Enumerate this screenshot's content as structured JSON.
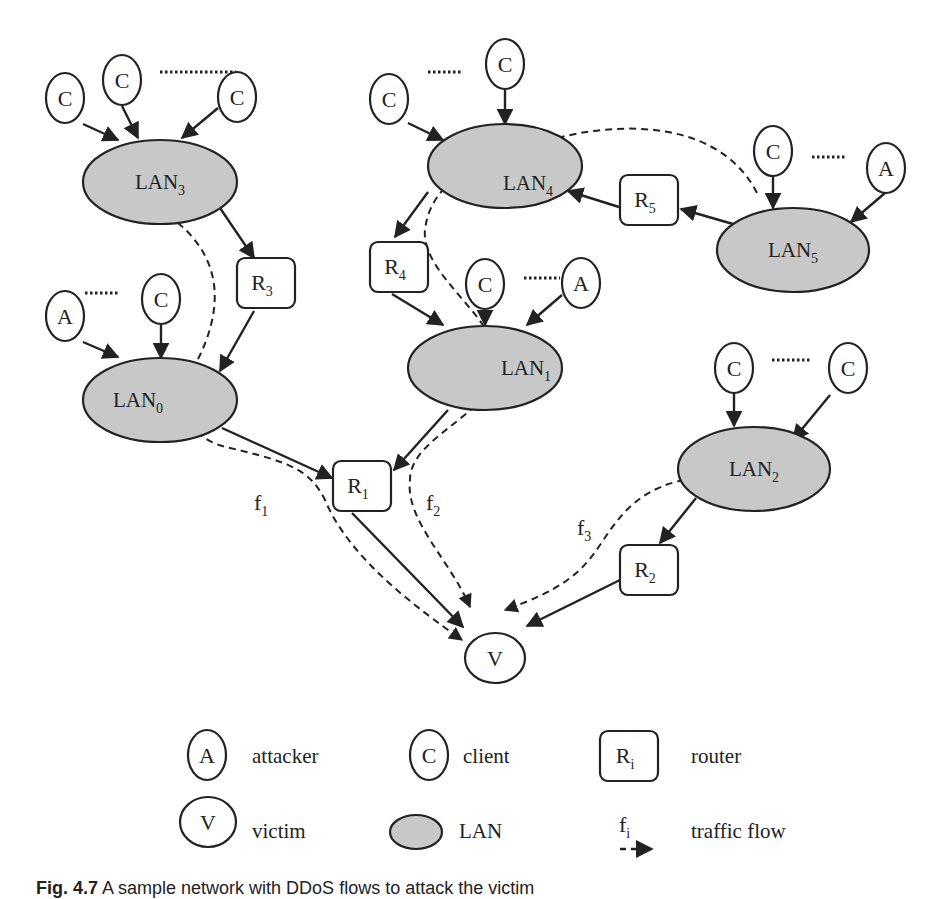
{
  "diagram": {
    "lans": [
      {
        "id": "LAN0",
        "label": "LAN",
        "sub": "0"
      },
      {
        "id": "LAN1",
        "label": "LAN",
        "sub": "1"
      },
      {
        "id": "LAN2",
        "label": "LAN",
        "sub": "2"
      },
      {
        "id": "LAN3",
        "label": "LAN",
        "sub": "3"
      },
      {
        "id": "LAN4",
        "label": "LAN",
        "sub": "4"
      },
      {
        "id": "LAN5",
        "label": "LAN",
        "sub": "5"
      }
    ],
    "routers": [
      {
        "id": "R1",
        "label": "R",
        "sub": "1"
      },
      {
        "id": "R2",
        "label": "R",
        "sub": "2"
      },
      {
        "id": "R3",
        "label": "R",
        "sub": "3"
      },
      {
        "id": "R4",
        "label": "R",
        "sub": "4"
      },
      {
        "id": "R5",
        "label": "R",
        "sub": "5"
      }
    ],
    "node_labels": {
      "client": "C",
      "attacker": "A",
      "victim": "V"
    },
    "flows": [
      {
        "id": "f1",
        "label": "f",
        "sub": "1",
        "path": [
          "LAN3",
          "LAN0",
          "V"
        ]
      },
      {
        "id": "f2",
        "label": "f",
        "sub": "2",
        "path": [
          "LAN5",
          "LAN4",
          "LAN1",
          "V"
        ]
      },
      {
        "id": "f3",
        "label": "f",
        "sub": "3",
        "path": [
          "LAN2",
          "V"
        ]
      }
    ],
    "edges": [
      [
        "C",
        "LAN3"
      ],
      [
        "C",
        "LAN3"
      ],
      [
        "C",
        "LAN3"
      ],
      [
        "LAN3",
        "R3"
      ],
      [
        "R3",
        "LAN0"
      ],
      [
        "A",
        "LAN0"
      ],
      [
        "C",
        "LAN0"
      ],
      [
        "LAN0",
        "R1"
      ],
      [
        "C",
        "LAN4"
      ],
      [
        "C",
        "LAN4"
      ],
      [
        "LAN4",
        "R4"
      ],
      [
        "R4",
        "LAN1"
      ],
      [
        "C",
        "LAN1"
      ],
      [
        "A",
        "LAN1"
      ],
      [
        "LAN1",
        "R1"
      ],
      [
        "LAN5",
        "R5"
      ],
      [
        "R5",
        "LAN4"
      ],
      [
        "C",
        "LAN5"
      ],
      [
        "A",
        "LAN5"
      ],
      [
        "C",
        "LAN2"
      ],
      [
        "C",
        "LAN2"
      ],
      [
        "LAN2",
        "R2"
      ],
      [
        "R1",
        "V"
      ],
      [
        "R2",
        "V"
      ]
    ]
  },
  "legend": {
    "attacker": {
      "symbol": "A",
      "label": "attacker"
    },
    "client": {
      "symbol": "C",
      "label": "client"
    },
    "router": {
      "symbol": "R",
      "sub": "i",
      "label": "router"
    },
    "victim": {
      "symbol": "V",
      "label": "victim"
    },
    "lan": {
      "label": "LAN"
    },
    "flow": {
      "symbol": "f",
      "sub": "i",
      "label": "traffic flow"
    }
  },
  "caption": {
    "prefix": "Fig. 4.7",
    "text": "A sample network with DDoS flows to attack the victim"
  }
}
